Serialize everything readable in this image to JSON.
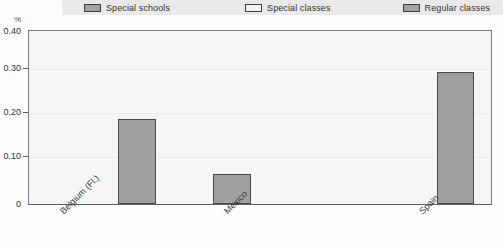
{
  "legend": {
    "items": [
      {
        "label": "Special schools",
        "style": "filled",
        "color": "#a3a3a3"
      },
      {
        "label": "Special classes",
        "style": "hollow",
        "color": "#f4f4f4"
      },
      {
        "label": "Regular classes",
        "style": "filled",
        "color": "#a3a3a3"
      }
    ]
  },
  "axis": {
    "unit": "%",
    "y_ticks": [
      "0.40",
      "0.30",
      "0.20",
      "0.10",
      "0"
    ]
  },
  "chart_data": {
    "type": "bar",
    "title": "",
    "subtitle": "",
    "xlabel": "",
    "ylabel": "%",
    "ylim": [
      0,
      0.4
    ],
    "ytick_values": [
      0.4,
      0.3,
      0.2,
      0.1,
      0
    ],
    "grid": true,
    "legend_position": "top",
    "categories": [
      "Belgium (Fl.)",
      "Mexico",
      "Spain"
    ],
    "series": [
      {
        "name": "Special schools",
        "values": [
          0.197,
          0.069,
          0.305
        ],
        "color": "#a0a0a0"
      },
      {
        "name": "Special classes",
        "values": [
          0,
          0,
          0
        ],
        "color": "#f4f4f4"
      },
      {
        "name": "Regular classes",
        "values": [
          0,
          0,
          0
        ],
        "color": "#a0a0a0"
      }
    ],
    "bar_color": "#a0a0a0",
    "bar_border_color": "#4a4a4a",
    "plot_background": "#f6f6f6"
  }
}
